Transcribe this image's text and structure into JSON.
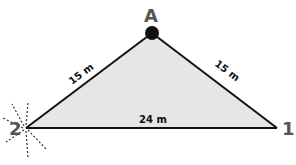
{
  "diagram": {
    "vertices": [
      {
        "id": "A",
        "label": "A",
        "x": 152,
        "y": 33
      },
      {
        "id": "1",
        "label": "1",
        "x": 277,
        "y": 128
      },
      {
        "id": "2",
        "label": "2",
        "x": 26,
        "y": 128
      }
    ],
    "edges": [
      {
        "from": "2",
        "to": "A",
        "label": "15 m"
      },
      {
        "from": "A",
        "to": "1",
        "label": "15 m"
      },
      {
        "from": "2",
        "to": "1",
        "label": "24 m"
      }
    ],
    "fill_color": "#e6e6e6",
    "stroke_color": "#111111",
    "label_color": "#555555",
    "source_marker": "vertex-2-burst"
  }
}
